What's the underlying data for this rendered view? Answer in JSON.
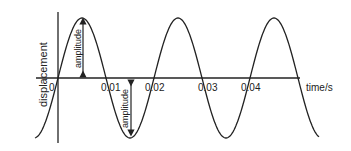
{
  "diagram": {
    "title": "",
    "y_axis_label": "displacement",
    "x_axis_label": "time/s",
    "tick_labels": [
      "0",
      "0.01",
      "0.02",
      "0.03",
      "0.04"
    ],
    "annotations": [
      "amplitude",
      "amplitude"
    ],
    "line_color": "#222222"
  },
  "chart_data": {
    "type": "line",
    "title": "",
    "xlabel": "time/s",
    "ylabel": "displacement",
    "x_ticks": [
      0,
      0.01,
      0.02,
      0.03,
      0.04
    ],
    "period_s": 0.02,
    "series": [
      {
        "name": "displacement",
        "shape": "sine",
        "cycles_shown": 2.75
      }
    ],
    "annotations": [
      {
        "text": "amplitude",
        "from": "zero",
        "to": "peak"
      },
      {
        "text": "amplitude",
        "from": "zero",
        "to": "trough"
      }
    ],
    "grid": false
  }
}
